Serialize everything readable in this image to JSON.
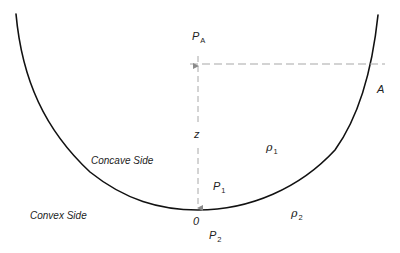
{
  "diagram": {
    "type": "interface-curvature-pressure",
    "colors": {
      "curve": "#111111",
      "dashed": "#a8a8a8",
      "text": "#222222",
      "background": "#ffffff"
    },
    "labels": {
      "pressure_top": {
        "symbol": "P",
        "subscript": "A"
      },
      "height": "z",
      "point_a": "A",
      "concave_side": "Concave Side",
      "convex_side": "Convex Side",
      "density_inner": {
        "symbol": "ρ",
        "subscript": "1"
      },
      "pressure_inner": {
        "symbol": "P",
        "subscript": "1"
      },
      "origin": "0",
      "density_outer": {
        "symbol": "ρ",
        "subscript": "2"
      },
      "pressure_outer": {
        "symbol": "P",
        "subscript": "2"
      }
    }
  }
}
